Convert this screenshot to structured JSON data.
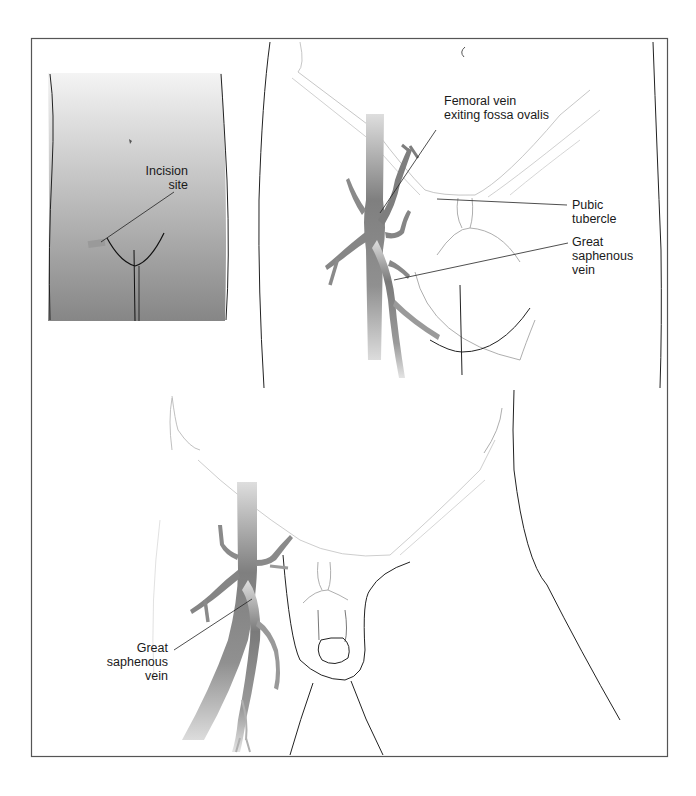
{
  "figure": {
    "type": "anatomical-illustration",
    "panels": [
      {
        "id": "inset",
        "description": "Anterior view of lower abdomen and groin showing incision location",
        "labels": [
          {
            "id": "incision-site",
            "text": "Incision\nsite"
          }
        ]
      },
      {
        "id": "upper-detail",
        "description": "Detail of right groin with femoral and great saphenous veins",
        "labels": [
          {
            "id": "femoral-vein",
            "text": "Femoral vein\nexiting fossa ovalis"
          },
          {
            "id": "pubic-tubercle",
            "text": "Pubic\ntubercle"
          },
          {
            "id": "great-saphenous-upper",
            "text": "Great\nsaphenous\nvein"
          }
        ]
      },
      {
        "id": "lower-detail",
        "description": "Wider view of groin showing great saphenous vein",
        "labels": [
          {
            "id": "great-saphenous-lower",
            "text": "Great\nsaphenous\nvein"
          }
        ]
      }
    ],
    "colors": {
      "frame": "#555555",
      "inset_gradient_top": "#f2f2f2",
      "inset_gradient_bottom": "#8a8a8a",
      "vein_dark": "#7d7d7d",
      "vein_light": "#d4d4d4",
      "incision_mark": "#9a9a9a",
      "outline": "#222222",
      "faint_outline": "#b8b8b8"
    }
  }
}
